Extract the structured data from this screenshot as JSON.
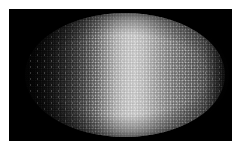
{
  "figure": {
    "title": "Embryo fluorescence micrograph",
    "caption": "Dorsoventral view of an ellipsoidal embryo showing a graded nuclear fluorescence signal along the anterior-posterior axis",
    "background_color": "#ffffff",
    "field_color": "#000000",
    "width_px": 241,
    "height_px": 151
  },
  "field": {
    "name": "imaging-field",
    "left_px": 9,
    "top_px": 9,
    "width_px": 223,
    "height_px": 132
  },
  "specimen": {
    "name": "embryo",
    "shape": "ellipse",
    "left_px": 25,
    "top_px": 13,
    "width_px": 200,
    "height_px": 124,
    "texture": "granular nuclear speckle",
    "anterior_side": "left",
    "posterior_side": "right"
  },
  "chart_data": {
    "type": "heatmap",
    "title": "Embryo fluorescence micrograph",
    "xlabel": "Anterior - Posterior position (% egg length)",
    "ylabel": "Dorsal - Ventral position",
    "grid": false,
    "legend": "none",
    "colormap": "grayscale",
    "intensity_range": [
      0,
      255
    ],
    "x": [
      0,
      5,
      10,
      15,
      20,
      25,
      30,
      35,
      40,
      45,
      50,
      55,
      60,
      65,
      70,
      75,
      80,
      85,
      90,
      95,
      100
    ],
    "series": [
      {
        "name": "mean nuclear intensity along A-P axis",
        "values": [
          3,
          7,
          14,
          26,
          42,
          63,
          92,
          126,
          158,
          186,
          203,
          207,
          196,
          176,
          158,
          142,
          130,
          118,
          96,
          58,
          16
        ]
      }
    ],
    "annotations": [
      {
        "label": "peak intensity band",
        "x": 55,
        "value": 207
      },
      {
        "label": "anterior dark domain",
        "x": 10,
        "value": 14
      },
      {
        "label": "posterior plateau",
        "x": 80,
        "value": 130
      }
    ]
  },
  "palette": {
    "background": "#ffffff",
    "field": "#000000",
    "darkest": "#030303",
    "mid": "#7e7e7e",
    "brightest": "#cfcfcf"
  }
}
